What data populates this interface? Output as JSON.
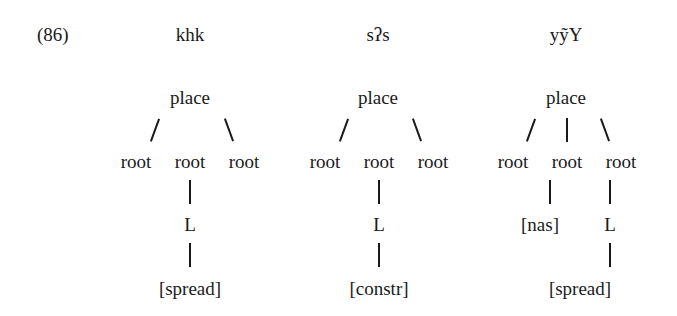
{
  "example_number": "(86)",
  "trees": [
    {
      "heading": "khk",
      "root_node": "place",
      "children": [
        "root",
        "root",
        "root"
      ],
      "middle_chain": [
        "L",
        "[spread]"
      ]
    },
    {
      "heading": "sʔs",
      "root_node": "place",
      "children": [
        "root",
        "root",
        "root"
      ],
      "middle_chain": [
        "L",
        "[constr]"
      ]
    },
    {
      "heading": "yỹY",
      "root_node": "place",
      "children": [
        "root",
        "root",
        "root"
      ],
      "middle_feature": "[nas]",
      "right_chain": [
        "L",
        "[spread]"
      ]
    }
  ]
}
